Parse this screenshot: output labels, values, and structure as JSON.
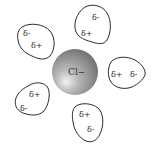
{
  "diagram": {
    "type": "ion-hydration",
    "ion": {
      "label": "Cl−",
      "color_highlight": "#e8e8e8",
      "color_mid": "#a8a8a8",
      "color_shadow": "#6a6a6a"
    },
    "molecules": [
      {
        "position": "top-left",
        "charges": [
          {
            "label": "δ-",
            "role": "negative"
          },
          {
            "label": "δ+",
            "role": "positive"
          }
        ]
      },
      {
        "position": "top",
        "charges": [
          {
            "label": "δ-",
            "role": "negative"
          },
          {
            "label": "δ+",
            "role": "positive"
          }
        ]
      },
      {
        "position": "right",
        "charges": [
          {
            "label": "δ+",
            "role": "positive"
          },
          {
            "label": "δ-",
            "role": "negative"
          }
        ]
      },
      {
        "position": "bottom-left",
        "charges": [
          {
            "label": "δ+",
            "role": "positive"
          },
          {
            "label": "δ-",
            "role": "negative"
          }
        ]
      },
      {
        "position": "bottom",
        "charges": [
          {
            "label": "δ+",
            "role": "positive"
          },
          {
            "label": "δ-",
            "role": "negative"
          }
        ]
      }
    ],
    "outline_color": "#2a2a2a",
    "background": "#ffffff"
  }
}
